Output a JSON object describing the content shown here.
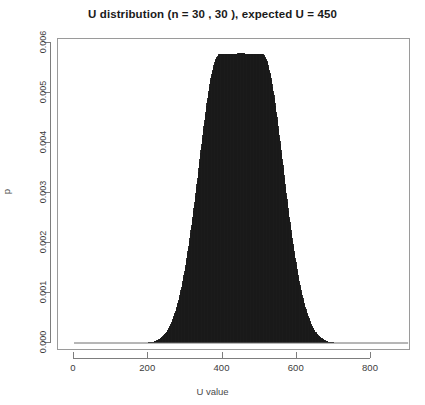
{
  "chart_data": {
    "type": "bar",
    "title": "U distribution (n = 30 , 30 ),  expected U = 450",
    "xlabel": "U value",
    "ylabel": "p",
    "xlim": [
      -35,
      935
    ],
    "ylim": [
      0,
      0.006
    ],
    "grid": false,
    "legend": null,
    "style": "impulse-lines (R type='h'), solid black fill",
    "x_ticks": [
      0,
      200,
      400,
      600,
      800
    ],
    "x_tick_labels": [
      "0",
      "200",
      "400",
      "600",
      "800"
    ],
    "y_ticks": [
      0,
      0.001,
      0.002,
      0.003,
      0.004,
      0.005,
      0.006
    ],
    "y_tick_labels": [
      "0.000",
      "0.001",
      "0.002",
      "0.003",
      "0.004",
      "0.005",
      "0.006"
    ],
    "series_name": "U null distribution",
    "distribution": {
      "name": "Mann-Whitney U null distribution",
      "n1": 30,
      "n2": 30,
      "expected_U": 450,
      "peak_p": 0.0058,
      "peak_U": 450,
      "support_min": 0,
      "support_max": 900,
      "visible_tail_min": 215,
      "visible_tail_max": 685
    },
    "x": [
      0,
      20,
      40,
      60,
      80,
      100,
      120,
      140,
      160,
      180,
      200,
      210,
      220,
      230,
      240,
      250,
      260,
      270,
      280,
      290,
      300,
      310,
      320,
      330,
      340,
      350,
      360,
      370,
      380,
      390,
      400,
      410,
      420,
      430,
      440,
      450,
      460,
      470,
      480,
      490,
      500,
      510,
      520,
      530,
      540,
      550,
      560,
      570,
      580,
      590,
      600,
      610,
      620,
      630,
      640,
      650,
      660,
      670,
      680,
      690,
      700,
      720,
      740,
      760,
      780,
      800,
      820,
      840,
      860,
      880,
      900
    ],
    "values": [
      0,
      0,
      0,
      0,
      0,
      0,
      0,
      0,
      0,
      0,
      1e-05,
      2e-05,
      4e-05,
      8e-05,
      0.00014,
      0.00023,
      0.00036,
      0.00055,
      0.0008,
      0.00112,
      0.00152,
      0.00199,
      0.00253,
      0.00312,
      0.00374,
      0.00435,
      0.00491,
      0.00535,
      0.00565,
      0.00578,
      0.00579,
      0.00579,
      0.00579,
      0.00579,
      0.00579,
      0.0058,
      0.00579,
      0.00579,
      0.00579,
      0.00579,
      0.00579,
      0.00578,
      0.00565,
      0.00535,
      0.00491,
      0.00435,
      0.00374,
      0.00312,
      0.00253,
      0.00199,
      0.00152,
      0.00112,
      0.0008,
      0.00055,
      0.00036,
      0.00023,
      0.00014,
      8e-05,
      4e-05,
      2e-05,
      1e-05,
      0,
      0,
      0,
      0,
      0,
      0,
      0,
      0,
      0,
      0
    ]
  },
  "colors": {
    "background": "#ffffff",
    "fill": "#1a1a1a",
    "axis": "#7d7d7d",
    "frame": "#9a9a9a",
    "text": "#1a1a1a"
  }
}
